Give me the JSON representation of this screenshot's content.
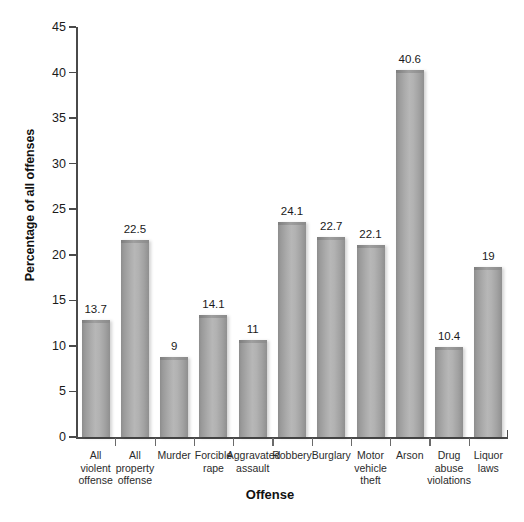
{
  "chart_data": {
    "type": "bar",
    "title": "",
    "xlabel": "Offense",
    "ylabel": "Percentage of all offenses",
    "ylim": [
      0,
      45
    ],
    "ytick_step": 5,
    "yticks": [
      "0",
      "5",
      "10",
      "15",
      "20",
      "25",
      "30",
      "35",
      "40",
      "45"
    ],
    "grid": false,
    "legend": null,
    "bar_color": "#ababab",
    "categories": [
      "All violent offense",
      "All property offense",
      "Murder",
      "Forcible rape",
      "Aggravated assault",
      "Robbery",
      "Burglary",
      "Motor vehicle theft",
      "Arson",
      "Drug abuse violations",
      "Liquor laws"
    ],
    "category_lines": [
      [
        "All",
        "violent",
        "offense"
      ],
      [
        "All",
        "property",
        "offense"
      ],
      [
        "Murder"
      ],
      [
        "Forcible",
        "rape"
      ],
      [
        "Aggravated",
        "assault"
      ],
      [
        "Robbery"
      ],
      [
        "Burglary"
      ],
      [
        "Motor",
        "vehicle",
        "theft"
      ],
      [
        "Arson"
      ],
      [
        "Drug",
        "abuse",
        "violations"
      ],
      [
        "Liquor",
        "laws"
      ]
    ],
    "values": [
      13.7,
      22.5,
      9,
      14.1,
      11,
      24.1,
      22.7,
      22.1,
      40.6,
      10.4,
      19
    ],
    "value_labels": [
      "13.7",
      "22.5",
      "9",
      "14.1",
      "11",
      "24.1",
      "22.7",
      "22.1",
      "40.6",
      "10.4",
      "19"
    ],
    "bar_pixel_heights": [
      12.8,
      21.6,
      8.8,
      13.4,
      10.7,
      23.6,
      22.0,
      21.1,
      40.3,
      9.9,
      18.7
    ]
  }
}
